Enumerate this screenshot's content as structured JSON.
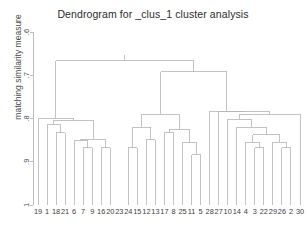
{
  "chart_data": {
    "type": "dendrogram",
    "title": "Dendrogram for _clus_1 cluster analysis",
    "xlabel": "",
    "ylabel": "matching similarity measure",
    "grid": false,
    "legend": "none",
    "axis_inverted": true,
    "ylim": [
      0.6,
      1.0
    ],
    "yticks": [
      ".6",
      ".7",
      ".8",
      ".9",
      "1"
    ],
    "ytick_values": [
      0.6,
      0.7,
      0.8,
      0.9,
      1.0
    ],
    "leaf_labels": [
      "19",
      "1",
      "18",
      "21",
      "6",
      "7",
      "9",
      "16",
      "20",
      "23",
      "24",
      "15",
      "12",
      "13",
      "17",
      "8",
      "25",
      "11",
      "5",
      "28",
      "27",
      "10",
      "14",
      "4",
      "3",
      "22",
      "29",
      "26",
      "2",
      "30"
    ],
    "n_leaves": 30,
    "leaf_baseline": 1.0,
    "line_color": "#b4b4b4",
    "text_color": "#3d3d3d",
    "merges": [
      {
        "id": "m1",
        "left": {
          "leaf": "18"
        },
        "right": {
          "leaf": "21"
        },
        "height": 0.833
      },
      {
        "id": "m2",
        "left": {
          "leaf": "1"
        },
        "right": {
          "node": "m1"
        },
        "height": 0.815
      },
      {
        "id": "m3",
        "left": {
          "leaf": "7"
        },
        "right": {
          "leaf": "9"
        },
        "height": 0.868
      },
      {
        "id": "m4",
        "left": {
          "leaf": "6"
        },
        "right": {
          "node": "m3"
        },
        "height": 0.852
      },
      {
        "id": "m5",
        "left": {
          "leaf": "16"
        },
        "right": {
          "leaf": "20"
        },
        "height": 0.868
      },
      {
        "id": "m6",
        "left": {
          "node": "m4"
        },
        "right": {
          "node": "m5"
        },
        "height": 0.848
      },
      {
        "id": "m7",
        "left": {
          "node": "m2"
        },
        "right": {
          "node": "m6"
        },
        "height": 0.804
      },
      {
        "id": "m8",
        "left": {
          "leaf": "19"
        },
        "right": {
          "node": "m7"
        },
        "height": 0.799
      },
      {
        "id": "m9",
        "left": {
          "leaf": "24"
        },
        "right": {
          "leaf": "15"
        },
        "height": 0.868
      },
      {
        "id": "m10",
        "left": {
          "leaf": "12"
        },
        "right": {
          "leaf": "13"
        },
        "height": 0.849
      },
      {
        "id": "m11",
        "left": {
          "node": "m9"
        },
        "right": {
          "node": "m10"
        },
        "height": 0.82
      },
      {
        "id": "m12",
        "left": {
          "leaf": "11"
        },
        "right": {
          "leaf": "5"
        },
        "height": 0.884
      },
      {
        "id": "m13",
        "left": {
          "leaf": "25"
        },
        "right": {
          "node": "m12"
        },
        "height": 0.855
      },
      {
        "id": "m14",
        "left": {
          "leaf": "17"
        },
        "right": {
          "leaf": "8"
        },
        "height": 0.833
      },
      {
        "id": "m15",
        "left": {
          "node": "m14"
        },
        "right": {
          "node": "m13"
        },
        "height": 0.825
      },
      {
        "id": "m16",
        "left": {
          "node": "m11"
        },
        "right": {
          "node": "m15"
        },
        "height": 0.79
      },
      {
        "id": "m17",
        "left": {
          "leaf": "3"
        },
        "right": {
          "leaf": "22"
        },
        "height": 0.868
      },
      {
        "id": "m18",
        "left": {
          "leaf": "4"
        },
        "right": {
          "node": "m17"
        },
        "height": 0.855
      },
      {
        "id": "m19",
        "left": {
          "leaf": "26"
        },
        "right": {
          "leaf": "2"
        },
        "height": 0.868
      },
      {
        "id": "m20",
        "left": {
          "leaf": "29"
        },
        "right": {
          "node": "m19"
        },
        "height": 0.855
      },
      {
        "id": "m21",
        "left": {
          "node": "m18"
        },
        "right": {
          "node": "m20"
        },
        "height": 0.838
      },
      {
        "id": "m22",
        "left": {
          "leaf": "14"
        },
        "right": {
          "node": "m21"
        },
        "height": 0.82
      },
      {
        "id": "m23",
        "left": {
          "leaf": "10"
        },
        "right": {
          "node": "m22"
        },
        "height": 0.802
      },
      {
        "id": "m24",
        "left": {
          "leaf": "30"
        },
        "right": {
          "node": "m23"
        },
        "height": 0.79
      },
      {
        "id": "m25",
        "left": {
          "leaf": "27"
        },
        "right": {
          "node": "m24"
        },
        "height": 0.784
      },
      {
        "id": "m26",
        "left": {
          "leaf": "28"
        },
        "right": {
          "node": "m25"
        },
        "height": 0.783
      },
      {
        "id": "m27",
        "left": {
          "node": "m16"
        },
        "right": {
          "node": "m26"
        },
        "height": 0.692
      },
      {
        "id": "m28",
        "left": {
          "node": "m8"
        },
        "right": {
          "node": "m27"
        },
        "height": 0.667
      }
    ]
  }
}
